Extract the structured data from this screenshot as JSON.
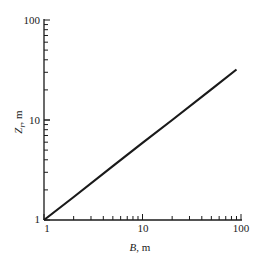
{
  "chart_data": {
    "type": "line",
    "title": "",
    "xlabel": "B, m",
    "ylabel": "Z_r, m",
    "xlabel_parts": {
      "var": "B",
      "unit": ", m"
    },
    "ylabel_parts": {
      "var": "Z",
      "sub": "r",
      "unit": ", m"
    },
    "xscale": "log",
    "yscale": "log",
    "xlim": [
      1,
      100
    ],
    "ylim": [
      1,
      100
    ],
    "x_ticks": [
      "1",
      "10",
      "100"
    ],
    "y_ticks": [
      "1",
      "10",
      "100"
    ],
    "grid": false,
    "legend": null,
    "series": [
      {
        "name": "Z_r vs B",
        "x": [
          1,
          2,
          5,
          10,
          20,
          50,
          90
        ],
        "y": [
          1,
          1.7,
          3.45,
          5.9,
          10,
          20.3,
          32
        ]
      }
    ]
  }
}
